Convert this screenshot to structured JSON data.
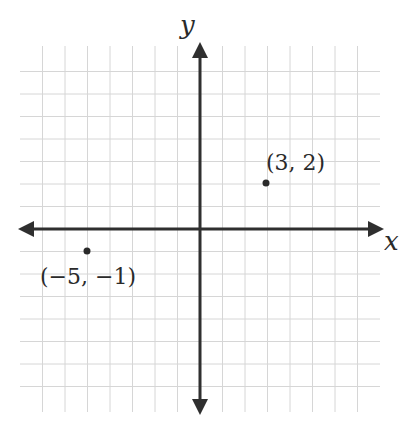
{
  "diagram": {
    "type": "coordinate-plane",
    "axes": {
      "x_label": "x",
      "y_label": "y"
    },
    "grid": {
      "x_min": -8,
      "x_max": 8,
      "y_min": -8,
      "y_max": 8,
      "line_color": "#d4d4d4",
      "axis_color": "#2f2f2f"
    },
    "points": [
      {
        "label": "(3, 2)",
        "x": 3,
        "y": 2
      },
      {
        "label": "(−5, −1)",
        "x": -5,
        "y": -1
      }
    ]
  }
}
